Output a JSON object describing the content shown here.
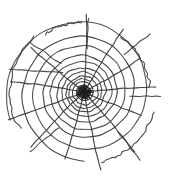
{
  "figure": {
    "title": "Spider web line drawing",
    "style": "hand-drawn ink sketch",
    "background_color": "#ffffff",
    "line_color": "#3a3a38",
    "hub_color": "#1c1c1c",
    "canvas": {
      "width": 172,
      "height": 183
    }
  },
  "web": {
    "hub": {
      "cx": 84,
      "cy": 92,
      "radius": 7
    },
    "radial_spokes": {
      "count": 12,
      "label": "radial-spokes",
      "inner_radius": 4,
      "angles_deg": [
        -88,
        -58,
        -31,
        -4,
        22,
        50,
        78,
        106,
        134,
        160,
        -172,
        -140
      ],
      "outer_radii": [
        78,
        74,
        66,
        72,
        62,
        78,
        80,
        70,
        76,
        80,
        74,
        70
      ],
      "jitter": [
        1.6,
        -1.2,
        2.0,
        -1.8,
        1.2,
        -2.2,
        1.5,
        -1.4,
        2.1,
        -1.0,
        1.8,
        -1.6
      ]
    },
    "spiral": {
      "type": "logarithmic",
      "label": "capture-spiral",
      "turns": 6.5,
      "start_radius": 4.5,
      "growth": 1.52,
      "direction": "counterclockwise",
      "start_angle_deg": -90,
      "segments_per_turn": 12
    },
    "outer_arcs": [
      {
        "name": "outer-arc-upper-left",
        "cx": 84,
        "cy": 92,
        "r": 74,
        "a0": 150,
        "a1": 228
      },
      {
        "name": "outer-arc-left-break",
        "cx": 84,
        "cy": 92,
        "r": 70,
        "a0": 236,
        "a1": 268
      },
      {
        "name": "outer-arc-lower-right",
        "cx": 84,
        "cy": 92,
        "r": 72,
        "a0": 16,
        "a1": 76
      },
      {
        "name": "outer-arc-upper-right",
        "cx": 84,
        "cy": 92,
        "r": 66,
        "a0": -56,
        "a1": -4
      }
    ],
    "anchor_threads": [
      {
        "name": "anchor-left-horizontal",
        "x1": 10,
        "y1": 70,
        "x2": 62,
        "y2": 72
      },
      {
        "name": "anchor-top-vertical",
        "x1": 88,
        "y1": 18,
        "x2": 87,
        "y2": 48
      },
      {
        "name": "anchor-upper-left-diagonal",
        "x1": 30,
        "y1": 42,
        "x2": 62,
        "y2": 64
      },
      {
        "name": "anchor-lower-left",
        "x1": 30,
        "y1": 152,
        "x2": 58,
        "y2": 128
      },
      {
        "name": "anchor-lower-right",
        "x1": 140,
        "y1": 160,
        "x2": 118,
        "y2": 132
      },
      {
        "name": "anchor-right",
        "x1": 160,
        "y1": 96,
        "x2": 130,
        "y2": 96
      },
      {
        "name": "anchor-upper-right",
        "x1": 150,
        "y1": 34,
        "x2": 124,
        "y2": 54
      }
    ],
    "stroke_width": 1.15,
    "hub_stroke_width": 1.0
  }
}
